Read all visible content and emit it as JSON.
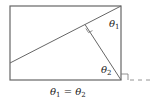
{
  "diagram": {
    "rectangle": {
      "x1": 10,
      "y1": 6,
      "x2": 121,
      "y2": 80
    },
    "diagonal": {
      "from": [
        10,
        63
      ],
      "to": [
        121,
        6
      ]
    },
    "perpendicular": {
      "from": [
        85,
        24
      ],
      "to": [
        121,
        80
      ]
    },
    "extension_line": {
      "from": [
        121,
        80
      ],
      "to": [
        153,
        80
      ],
      "style": "dashed"
    },
    "labels": {
      "theta1": {
        "symbol": "θ",
        "sub": "1"
      },
      "theta2": {
        "symbol": "θ",
        "sub": "2"
      },
      "caption": "θ₁ = θ₂"
    },
    "right_angle_markers": 2,
    "colors": {
      "stroke": "#555555",
      "text": "#222222"
    }
  }
}
